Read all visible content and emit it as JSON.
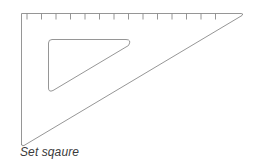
{
  "diagram": {
    "caption": "Set sqaure",
    "stroke_color": "#8a8a8a",
    "tick_count": 14
  }
}
